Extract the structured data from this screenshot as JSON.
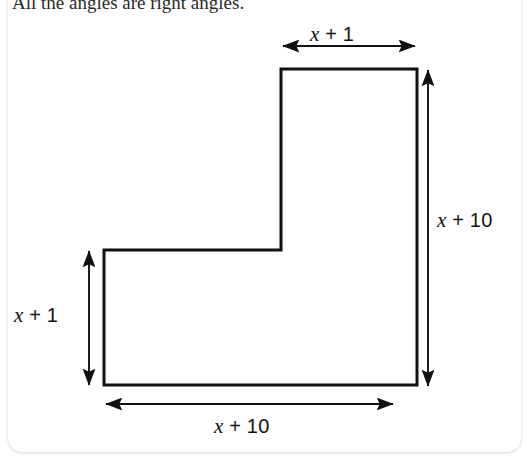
{
  "page": {
    "background_color": "#ffffff",
    "card_color": "#ffffff",
    "ink_color": "#111111"
  },
  "prompt": {
    "text": "All the angles are right angles."
  },
  "figure": {
    "name": "l-shaped-polygon",
    "stroke_color": "#111111",
    "stroke_width": 3,
    "vertices": [
      {
        "name": "top-arm-top-left",
        "x": 281,
        "y": 69
      },
      {
        "name": "top-arm-top-right",
        "x": 417,
        "y": 69
      },
      {
        "name": "bottom-right",
        "x": 417,
        "y": 385
      },
      {
        "name": "bottom-left",
        "x": 104,
        "y": 385
      },
      {
        "name": "left-arm-top-left",
        "x": 104,
        "y": 250
      },
      {
        "name": "inner-corner",
        "x": 281,
        "y": 250
      }
    ]
  },
  "dimensions": [
    {
      "id": "top",
      "name": "top-width-dimension",
      "label": {
        "variable": "x",
        "operator": "+",
        "constant": "1"
      },
      "label_text": "x + 1",
      "orientation": "horizontal",
      "arrow": {
        "x1": 283,
        "y1": 46,
        "x2": 415,
        "y2": 46
      }
    },
    {
      "id": "right",
      "name": "right-height-dimension",
      "label": {
        "variable": "x",
        "operator": "+",
        "constant": "10"
      },
      "label_text": "x + 10",
      "orientation": "vertical",
      "arrow": {
        "x1": 428,
        "y1": 70,
        "x2": 428,
        "y2": 386
      }
    },
    {
      "id": "left",
      "name": "left-height-dimension",
      "label": {
        "variable": "x",
        "operator": "+",
        "constant": "1"
      },
      "label_text": "x + 1",
      "orientation": "vertical",
      "arrow": {
        "x1": 89,
        "y1": 251,
        "x2": 89,
        "y2": 385
      }
    },
    {
      "id": "bottom",
      "name": "bottom-width-dimension",
      "label": {
        "variable": "x",
        "operator": "+",
        "constant": "10"
      },
      "label_text": "x + 10",
      "orientation": "horizontal",
      "arrow": {
        "x1": 106,
        "y1": 404,
        "x2": 393,
        "y2": 404
      }
    }
  ]
}
